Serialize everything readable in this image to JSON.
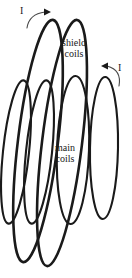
{
  "figure": {
    "type": "technical-diagram",
    "background_color": "#ffffff",
    "stroke_color": "#1a1a1a",
    "labels": {
      "shield_coils_line1": "shield",
      "shield_coils_line2": "coils",
      "main_coils_line1": "main",
      "main_coils_line2": "coils",
      "current_left": "I",
      "current_right": "I"
    },
    "annotations": [
      {
        "name": "current-arrow-left",
        "label": "I",
        "description": "curved arrow indicating current direction on outer shield coil, pointing up-right"
      },
      {
        "name": "current-arrow-right",
        "label": "I",
        "description": "curved arrow indicating current direction on right main coil, pointing up-left"
      }
    ],
    "coils": [
      {
        "name": "shield-coil-back",
        "group": "shield",
        "cx": 38,
        "cy": 141,
        "rx": 20,
        "ry": 122,
        "tilt_deg": 7
      },
      {
        "name": "shield-coil-front",
        "group": "shield",
        "cx": 62,
        "cy": 143,
        "rx": 20,
        "ry": 124,
        "tilt_deg": 7
      },
      {
        "name": "main-coil-outer-left",
        "group": "main",
        "cx": 16,
        "cy": 152,
        "rx": 13,
        "ry": 72,
        "tilt_deg": 6
      },
      {
        "name": "main-coil-inner-left",
        "group": "main",
        "cx": 39,
        "cy": 152,
        "rx": 13,
        "ry": 72,
        "tilt_deg": 6
      },
      {
        "name": "main-coil-center",
        "group": "main",
        "cx": 73,
        "cy": 150,
        "rx": 16,
        "ry": 74,
        "tilt_deg": 2
      },
      {
        "name": "main-coil-right",
        "group": "main",
        "cx": 104,
        "cy": 148,
        "rx": 14,
        "ry": 71,
        "tilt_deg": 1
      }
    ]
  }
}
